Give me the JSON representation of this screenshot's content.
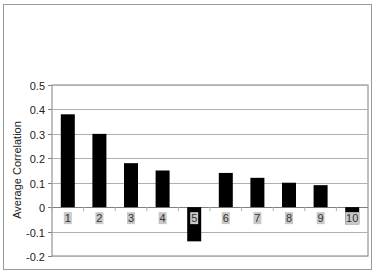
{
  "chart_data": {
    "type": "bar",
    "title": "",
    "xlabel": "",
    "ylabel": "Average Correlation",
    "categories": [
      "1",
      "2",
      "3",
      "4",
      "5",
      "6",
      "7",
      "8",
      "9",
      "10"
    ],
    "values": [
      0.38,
      0.3,
      0.18,
      0.15,
      -0.14,
      0.14,
      0.12,
      0.1,
      0.09,
      -0.07
    ],
    "ylim": [
      -0.2,
      0.5
    ],
    "yticks": [
      "0.5",
      "0.4",
      "0.3",
      "0.2",
      "0.1",
      "0",
      "-0.1",
      "-0.2"
    ],
    "grid": true,
    "legend": null,
    "colors": {
      "bar": "#000000",
      "grid": "#b0b0b0",
      "axis": "#808080",
      "label_bg": "#c8c8c8"
    }
  }
}
